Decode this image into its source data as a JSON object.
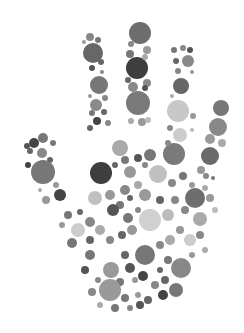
{
  "image": {
    "subject": "Hand made of gray circles",
    "background": "#ffffff",
    "width": 244,
    "height": 333
  },
  "circles": [
    [
      140,
      33,
      11,
      "#6e6e6e"
    ],
    [
      137,
      68,
      11,
      "#3e3e3e"
    ],
    [
      138,
      103,
      12,
      "#7a7a7a"
    ],
    [
      131,
      44,
      3,
      "#888"
    ],
    [
      147,
      50,
      4,
      "#999"
    ],
    [
      130,
      54,
      4,
      "#777"
    ],
    [
      145,
      57,
      3,
      "#aaa"
    ],
    [
      128,
      80,
      3,
      "#666"
    ],
    [
      147,
      83,
      4,
      "#888"
    ],
    [
      133,
      87,
      5,
      "#8a8a8a"
    ],
    [
      145,
      88,
      3,
      "#555"
    ],
    [
      142,
      122,
      4,
      "#999"
    ],
    [
      131,
      121,
      3,
      "#aaa"
    ],
    [
      148,
      120,
      3,
      "#bbb"
    ],
    [
      93,
      53,
      10,
      "#676767"
    ],
    [
      90,
      37,
      4,
      "#888"
    ],
    [
      98,
      40,
      3,
      "#777"
    ],
    [
      84,
      42,
      2,
      "#999"
    ],
    [
      101,
      62,
      3,
      "#666"
    ],
    [
      92,
      68,
      3,
      "#555"
    ],
    [
      102,
      72,
      2,
      "#888"
    ],
    [
      99,
      85,
      9,
      "#777"
    ],
    [
      90,
      96,
      2,
      "#999"
    ],
    [
      105,
      98,
      3,
      "#888"
    ],
    [
      96,
      105,
      6,
      "#8a8a8a"
    ],
    [
      92,
      113,
      3,
      "#777"
    ],
    [
      104,
      112,
      3,
      "#666"
    ],
    [
      97,
      121,
      4,
      "#444"
    ],
    [
      108,
      123,
      3,
      "#888"
    ],
    [
      90,
      128,
      3,
      "#666"
    ],
    [
      188,
      61,
      6,
      "#888"
    ],
    [
      174,
      50,
      3,
      "#777"
    ],
    [
      183,
      48,
      3,
      "#888"
    ],
    [
      190,
      50,
      3,
      "#555"
    ],
    [
      176,
      61,
      3,
      "#666"
    ],
    [
      178,
      71,
      3,
      "#888"
    ],
    [
      192,
      72,
      2,
      "#999"
    ],
    [
      181,
      86,
      8,
      "#666"
    ],
    [
      172,
      96,
      2,
      "#aaa"
    ],
    [
      178,
      111,
      11,
      "#c8c8c8"
    ],
    [
      193,
      116,
      3,
      "#999"
    ],
    [
      170,
      128,
      3,
      "#888"
    ],
    [
      180,
      135,
      7,
      "#cccccc"
    ],
    [
      192,
      130,
      2,
      "#bbb"
    ],
    [
      174,
      154,
      11,
      "#7a7a7a"
    ],
    [
      168,
      143,
      3,
      "#888"
    ],
    [
      221,
      108,
      8,
      "#777"
    ],
    [
      218,
      127,
      9,
      "#888"
    ],
    [
      210,
      139,
      5,
      "#999"
    ],
    [
      222,
      143,
      4,
      "#aaa"
    ],
    [
      210,
      156,
      9,
      "#6a6a6a"
    ],
    [
      201,
      170,
      4,
      "#999"
    ],
    [
      206,
      176,
      3,
      "#888"
    ],
    [
      213,
      178,
      2,
      "#777"
    ],
    [
      34,
      143,
      5,
      "#444"
    ],
    [
      30,
      151,
      3,
      "#666"
    ],
    [
      43,
      138,
      5,
      "#777"
    ],
    [
      42,
      153,
      5,
      "#888"
    ],
    [
      53,
      143,
      3,
      "#777"
    ],
    [
      27,
      146,
      3,
      "#555"
    ],
    [
      50,
      160,
      3,
      "#666"
    ],
    [
      43,
      172,
      12,
      "#777"
    ],
    [
      28,
      165,
      3,
      "#444"
    ],
    [
      56,
      185,
      3,
      "#999"
    ],
    [
      60,
      195,
      6,
      "#444"
    ],
    [
      46,
      200,
      4,
      "#999"
    ],
    [
      40,
      190,
      2,
      "#aaa"
    ],
    [
      101,
      173,
      11,
      "#3e3e3e"
    ],
    [
      120,
      148,
      8,
      "#aaa"
    ],
    [
      125,
      160,
      4,
      "#777"
    ],
    [
      115,
      165,
      3,
      "#666"
    ],
    [
      130,
      172,
      6,
      "#999"
    ],
    [
      138,
      158,
      4,
      "#555"
    ],
    [
      145,
      165,
      3,
      "#888"
    ],
    [
      150,
      155,
      6,
      "#777"
    ],
    [
      158,
      174,
      9,
      "#c0c0c0"
    ],
    [
      172,
      183,
      4,
      "#888"
    ],
    [
      183,
      176,
      4,
      "#777"
    ],
    [
      192,
      185,
      3,
      "#999"
    ],
    [
      195,
      198,
      10,
      "#6e6e6e"
    ],
    [
      205,
      188,
      3,
      "#aaa"
    ],
    [
      210,
      198,
      4,
      "#999"
    ],
    [
      215,
      210,
      3,
      "#bbb"
    ],
    [
      200,
      219,
      7,
      "#aaa"
    ],
    [
      185,
      210,
      4,
      "#888"
    ],
    [
      95,
      198,
      7,
      "#c0c0c0"
    ],
    [
      110,
      195,
      5,
      "#999"
    ],
    [
      120,
      205,
      4,
      "#777"
    ],
    [
      113,
      210,
      6,
      "#555"
    ],
    [
      125,
      190,
      5,
      "#888"
    ],
    [
      138,
      185,
      4,
      "#aaa"
    ],
    [
      145,
      195,
      6,
      "#999"
    ],
    [
      130,
      198,
      3,
      "#666"
    ],
    [
      150,
      220,
      11,
      "#d0d0d0"
    ],
    [
      168,
      215,
      6,
      "#bbb"
    ],
    [
      175,
      200,
      4,
      "#888"
    ],
    [
      160,
      200,
      4,
      "#666"
    ],
    [
      138,
      210,
      3,
      "#888"
    ],
    [
      128,
      218,
      5,
      "#777"
    ],
    [
      78,
      230,
      7,
      "#cccccc"
    ],
    [
      90,
      222,
      5,
      "#888"
    ],
    [
      68,
      215,
      4,
      "#777"
    ],
    [
      80,
      212,
      3,
      "#666"
    ],
    [
      62,
      225,
      3,
      "#999"
    ],
    [
      72,
      243,
      5,
      "#777"
    ],
    [
      90,
      240,
      4,
      "#666"
    ],
    [
      100,
      230,
      5,
      "#aaa"
    ],
    [
      110,
      240,
      4,
      "#888"
    ],
    [
      122,
      235,
      4,
      "#666"
    ],
    [
      132,
      230,
      5,
      "#999"
    ],
    [
      145,
      255,
      10,
      "#777"
    ],
    [
      160,
      245,
      4,
      "#888"
    ],
    [
      170,
      240,
      5,
      "#aaa"
    ],
    [
      180,
      230,
      4,
      "#999"
    ],
    [
      190,
      240,
      6,
      "#ccc"
    ],
    [
      200,
      235,
      4,
      "#888"
    ],
    [
      205,
      250,
      3,
      "#aaa"
    ],
    [
      181,
      268,
      10,
      "#888"
    ],
    [
      168,
      260,
      4,
      "#777"
    ],
    [
      160,
      270,
      3,
      "#666"
    ],
    [
      192,
      255,
      3,
      "#999"
    ],
    [
      111,
      270,
      8,
      "#999"
    ],
    [
      90,
      255,
      5,
      "#777"
    ],
    [
      85,
      270,
      4,
      "#555"
    ],
    [
      98,
      280,
      3,
      "#888"
    ],
    [
      125,
      255,
      4,
      "#666"
    ],
    [
      130,
      268,
      5,
      "#555"
    ],
    [
      120,
      282,
      4,
      "#777"
    ],
    [
      135,
      280,
      3,
      "#999"
    ],
    [
      143,
      276,
      5,
      "#444"
    ],
    [
      155,
      285,
      4,
      "#888"
    ],
    [
      165,
      280,
      4,
      "#666"
    ],
    [
      176,
      290,
      7,
      "#777"
    ],
    [
      163,
      295,
      5,
      "#444"
    ],
    [
      110,
      290,
      11,
      "#999"
    ],
    [
      92,
      292,
      4,
      "#888"
    ],
    [
      125,
      298,
      4,
      "#777"
    ],
    [
      138,
      295,
      3,
      "#999"
    ],
    [
      148,
      300,
      4,
      "#666"
    ],
    [
      100,
      305,
      3,
      "#aaa"
    ],
    [
      115,
      308,
      4,
      "#777"
    ],
    [
      130,
      308,
      3,
      "#888"
    ],
    [
      140,
      305,
      4,
      "#555"
    ]
  ]
}
